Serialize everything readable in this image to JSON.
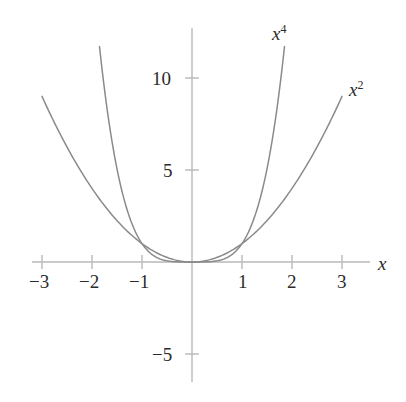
{
  "chart_data": {
    "type": "line",
    "title": "",
    "xlabel": "x",
    "ylabel": "",
    "grid": false,
    "legend_position": "inline-curve-labels",
    "xlim": [
      -3.55,
      3.55
    ],
    "ylim": [
      -7.2,
      12.5
    ],
    "x_ticks": [
      -3,
      -2,
      -1,
      1,
      2,
      3
    ],
    "x_tick_labels": [
      "−3",
      "−2",
      "−1",
      "1",
      "2",
      "3"
    ],
    "y_ticks": [
      -5,
      5,
      10
    ],
    "y_tick_labels": [
      "−5",
      "5",
      "10"
    ],
    "series": [
      {
        "name": "x²",
        "label": "x",
        "exponent": "2",
        "color": "#8a8a8a",
        "x": [
          -3,
          -2.75,
          -2.5,
          -2.25,
          -2,
          -1.75,
          -1.5,
          -1.25,
          -1,
          -0.75,
          -0.5,
          -0.25,
          0,
          0.25,
          0.5,
          0.75,
          1,
          1.25,
          1.5,
          1.75,
          2,
          2.25,
          2.5,
          2.75,
          3
        ],
        "values": [
          9,
          7.5625,
          6.25,
          5.0625,
          4,
          3.0625,
          2.25,
          1.5625,
          1,
          0.5625,
          0.25,
          0.0625,
          0,
          0.0625,
          0.25,
          0.5625,
          1,
          1.5625,
          2.25,
          3.0625,
          4,
          5.0625,
          6.25,
          7.5625,
          9
        ]
      },
      {
        "name": "x⁴",
        "label": "x",
        "exponent": "4",
        "color": "#8a8a8a",
        "x": [
          -1.85,
          -1.75,
          -1.6,
          -1.45,
          -1.3,
          -1.15,
          -1,
          -0.85,
          -0.7,
          -0.55,
          -0.4,
          -0.25,
          0,
          0.25,
          0.4,
          0.55,
          0.7,
          0.85,
          1,
          1.15,
          1.3,
          1.45,
          1.6,
          1.75,
          1.85
        ],
        "values": [
          11.71,
          9.3789,
          6.5536,
          4.4205,
          2.8561,
          1.749,
          1,
          0.522,
          0.2401,
          0.0915,
          0.0256,
          0.0039,
          0,
          0.0039,
          0.0256,
          0.0915,
          0.2401,
          0.522,
          1,
          1.749,
          2.8561,
          4.4205,
          6.5536,
          9.3789,
          11.71
        ]
      }
    ],
    "annotations": [
      {
        "name": "x4-curve-label",
        "text": "x",
        "exponent": "4"
      },
      {
        "name": "x2-curve-label",
        "text": "x",
        "exponent": "2"
      }
    ],
    "axis_color": "#b9b9b9",
    "text_color": "#2b2b2b",
    "background": "#ffffff"
  },
  "labels": {
    "x_axis_name": "x",
    "x_tick_neg3": "−3",
    "x_tick_neg2": "−2",
    "x_tick_neg1": "−1",
    "x_tick_1": "1",
    "x_tick_2": "2",
    "x_tick_3": "3",
    "y_tick_10": "10",
    "y_tick_5": "5",
    "y_tick_neg5": "−5",
    "curve_x4_base": "x",
    "curve_x4_exp": "4",
    "curve_x2_base": "x",
    "curve_x2_exp": "2"
  }
}
